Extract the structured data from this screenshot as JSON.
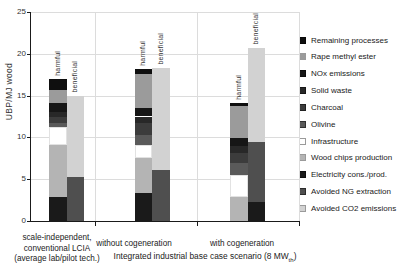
{
  "figure": {
    "ylabel_text": "UBP/MJ wood",
    "caption_prefix": "Integrated industrial base case scenario (8 MW",
    "caption_sub": "th",
    "caption_suffix": ")"
  },
  "chart_data": {
    "type": "bar",
    "stacked": true,
    "title": "",
    "xlabel": "",
    "ylabel": "UBP/MJ wood",
    "ylim": [
      0,
      25
    ],
    "yticks": [
      0,
      5,
      10,
      15,
      20,
      25
    ],
    "grid": true,
    "legend_position": "right",
    "bar_orientation_labels": [
      "harmful",
      "beneficial"
    ],
    "series_colors": {
      "Remaining processes": "#0f0f0f",
      "Rape methyl ester": "#9b9b9b",
      "NOx emissions": "#161616",
      "Solid waste": "#282828",
      "Charcoal": "#3c3c3c",
      "Olivine": "#5a5a5a",
      "Infrastructure": "#ffffff",
      "Wood chips production": "#b4b4b4",
      "Electricity cons./prod.": "#1a1a1a",
      "Avoided NG extraction": "#4f4f4f",
      "Avoided CO2 emissions": "#d2d2d2"
    },
    "legend": [
      "Remaining processes",
      "Rape methyl ester",
      "NOx emissions",
      "Solid waste",
      "Charcoal",
      "Olivine",
      "Infrastructure",
      "Wood chips production",
      "Electricity cons./prod.",
      "Avoided NG extraction",
      "Avoided CO2 emissions"
    ],
    "groups": [
      {
        "label_lines": [
          "scale-independent,",
          "conventional LCIA",
          "(average lab/pilot tech.)"
        ],
        "bars": [
          {
            "name": "harmful",
            "total": 17.0,
            "stack": [
              {
                "series": "Electricity cons./prod.",
                "value": 2.9
              },
              {
                "series": "Wood chips production",
                "value": 6.2
              },
              {
                "series": "Infrastructure",
                "value": 2.2
              },
              {
                "series": "Olivine",
                "value": 0.4
              },
              {
                "series": "Charcoal",
                "value": 0.7
              },
              {
                "series": "Solid waste",
                "value": 0.6
              },
              {
                "series": "NOx emissions",
                "value": 1.1
              },
              {
                "series": "Rape methyl ester",
                "value": 1.6
              },
              {
                "series": "Remaining processes",
                "value": 1.3
              }
            ]
          },
          {
            "name": "beneficial",
            "total": 15.0,
            "stack": [
              {
                "series": "Avoided NG extraction",
                "value": 5.3
              },
              {
                "series": "Avoided CO2 emissions",
                "value": 9.7
              }
            ]
          }
        ]
      },
      {
        "label_lines": [
          "without cogeneration"
        ],
        "bars": [
          {
            "name": "harmful",
            "total": 18.2,
            "stack": [
              {
                "series": "Electricity cons./prod.",
                "value": 3.3
              },
              {
                "series": "Wood chips production",
                "value": 4.2
              },
              {
                "series": "Infrastructure",
                "value": 1.6
              },
              {
                "series": "Olivine",
                "value": 1.2
              },
              {
                "series": "Charcoal",
                "value": 1.4
              },
              {
                "series": "Solid waste",
                "value": 0.8
              },
              {
                "series": "NOx emissions",
                "value": 1.0
              },
              {
                "series": "Rape methyl ester",
                "value": 4.1
              },
              {
                "series": "Remaining processes",
                "value": 0.6
              }
            ]
          },
          {
            "name": "beneficial",
            "total": 18.3,
            "stack": [
              {
                "series": "Avoided NG extraction",
                "value": 6.1
              },
              {
                "series": "Avoided CO2 emissions",
                "value": 12.2
              }
            ]
          }
        ]
      },
      {
        "label_lines": [
          "with cogeneration"
        ],
        "bars": [
          {
            "name": "harmful",
            "total": 14.1,
            "stack": [
              {
                "series": "Wood chips production",
                "value": 2.9
              },
              {
                "series": "Infrastructure",
                "value": 2.6
              },
              {
                "series": "Olivine",
                "value": 1.4
              },
              {
                "series": "Charcoal",
                "value": 1.2
              },
              {
                "series": "Solid waste",
                "value": 0.9
              },
              {
                "series": "NOx emissions",
                "value": 0.9
              },
              {
                "series": "Rape methyl ester",
                "value": 3.8
              },
              {
                "series": "Remaining processes",
                "value": 0.4
              }
            ]
          },
          {
            "name": "beneficial",
            "total": 20.7,
            "stack": [
              {
                "series": "Electricity cons./prod.",
                "value": 2.3
              },
              {
                "series": "Avoided NG extraction",
                "value": 7.2
              },
              {
                "series": "Avoided CO2 emissions",
                "value": 11.2
              }
            ]
          }
        ]
      }
    ]
  }
}
